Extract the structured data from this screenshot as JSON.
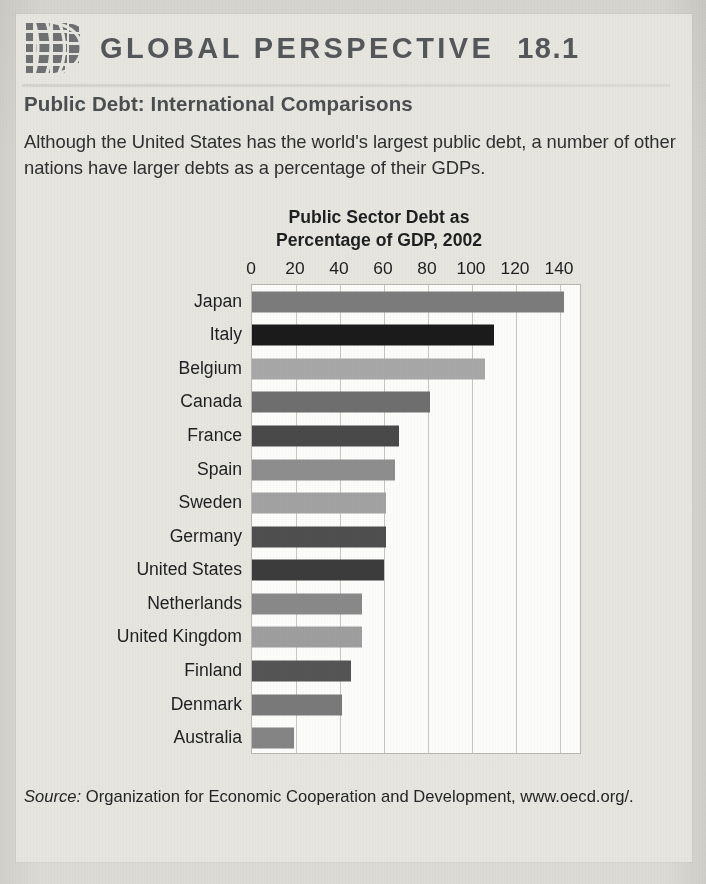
{
  "header": {
    "logo_icon": "globe-icon",
    "title": "GLOBAL PERSPECTIVE",
    "number": "18.1"
  },
  "article": {
    "subtitle": "Public Debt: International Comparisons",
    "body": "Although the United States has the world's largest public debt, a number of other nations have larger debts as a percentage of their GDPs."
  },
  "source": {
    "label": "Source:",
    "text": " Organization for Economic Cooperation and Development, www.oecd.org/."
  },
  "chart_data": {
    "type": "bar",
    "orientation": "horizontal",
    "title": "Public Sector Debt as Percentage of GDP, 2002",
    "title_line1": "Public Sector Debt as",
    "title_line2": "Percentage of GDP, 2002",
    "xlabel": "",
    "ylabel": "",
    "xlim": [
      0,
      150
    ],
    "ticks": [
      0,
      20,
      40,
      60,
      80,
      100,
      120,
      140
    ],
    "tick_labels": [
      "0",
      "20",
      "40",
      "60",
      "80",
      "100",
      "120",
      "140"
    ],
    "grid": "vertical",
    "legend": "none",
    "categories": [
      "Japan",
      "Italy",
      "Belgium",
      "Canada",
      "France",
      "Spain",
      "Sweden",
      "Germany",
      "United States",
      "Netherlands",
      "United Kingdom",
      "Finland",
      "Denmark",
      "Australia"
    ],
    "values": [
      142,
      110,
      106,
      81,
      67,
      65,
      61,
      61,
      60,
      50,
      50,
      45,
      41,
      19
    ],
    "bar_colors": [
      "#7c7c7c",
      "#1b1b1b",
      "#a8a8a8",
      "#6f6f6f",
      "#4a4a4a",
      "#8e8e8e",
      "#a3a3a3",
      "#4f4f4f",
      "#3c3c3c",
      "#8a8a8a",
      "#9f9f9f",
      "#555555",
      "#7a7a7a",
      "#858585"
    ]
  }
}
